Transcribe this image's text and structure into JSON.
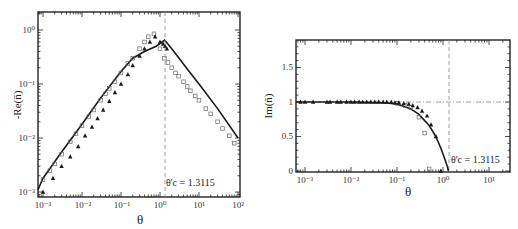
{
  "chart_data": [
    {
      "type": "scatter",
      "panel": "left",
      "title": "",
      "xlabel": "θ",
      "ylabel": "-Re(n̄)",
      "xscale": "log",
      "yscale": "log",
      "xlim": [
        0.0006,
        100
      ],
      "ylim": [
        0.0008,
        2
      ],
      "xticks": [
        "10^-3",
        "10^-2",
        "10^-1",
        "10^0",
        "10^1",
        "10^2"
      ],
      "yticks": [
        "10^-3",
        "10^-2",
        "10^-1",
        "10^0"
      ],
      "grid": false,
      "legend": null,
      "annotations": [
        {
          "text": "θ'c = 1.3115",
          "x": 1.3115,
          "type": "dashed-vertical-line"
        }
      ],
      "series": [
        {
          "name": "solid line",
          "style": "line",
          "x": [
            0.0006,
            0.001,
            0.003,
            0.01,
            0.03,
            0.1,
            0.2,
            0.4,
            0.8,
            1.3115,
            2,
            5,
            10,
            30,
            100
          ],
          "y": [
            0.0011,
            0.0018,
            0.0055,
            0.018,
            0.055,
            0.17,
            0.3,
            0.4,
            0.5,
            0.65,
            0.45,
            0.19,
            0.1,
            0.035,
            0.01
          ]
        },
        {
          "name": "open squares",
          "style": "square-open",
          "x": [
            0.0007,
            0.001,
            0.0015,
            0.002,
            0.003,
            0.005,
            0.007,
            0.01,
            0.015,
            0.02,
            0.03,
            0.04,
            0.05,
            0.07,
            0.1,
            0.15,
            0.2,
            0.3,
            0.4,
            0.5,
            0.7,
            1.0,
            1.3,
            1.6,
            2.0,
            2.5,
            3.0,
            4.0,
            5.0,
            6.0,
            8.0,
            10,
            15,
            20,
            30,
            40,
            60,
            80
          ],
          "y": [
            0.0012,
            0.0017,
            0.0025,
            0.0033,
            0.005,
            0.0085,
            0.012,
            0.017,
            0.025,
            0.033,
            0.05,
            0.066,
            0.083,
            0.11,
            0.16,
            0.24,
            0.3,
            0.45,
            0.6,
            0.75,
            0.85,
            0.45,
            0.3,
            0.25,
            0.2,
            0.16,
            0.14,
            0.11,
            0.09,
            0.075,
            0.06,
            0.05,
            0.035,
            0.028,
            0.02,
            0.015,
            0.011,
            0.008
          ]
        },
        {
          "name": "filled triangles",
          "style": "triangle-filled",
          "x": [
            0.001,
            0.0018,
            0.003,
            0.005,
            0.008,
            0.012,
            0.018,
            0.025,
            0.035,
            0.05,
            0.07,
            0.1,
            0.15,
            0.2,
            0.3,
            0.4,
            0.55,
            0.75,
            1.0,
            1.2,
            1.35,
            1.5
          ],
          "y": [
            0.001,
            0.0018,
            0.003,
            0.0045,
            0.007,
            0.011,
            0.016,
            0.023,
            0.033,
            0.048,
            0.07,
            0.1,
            0.15,
            0.22,
            0.33,
            0.45,
            0.6,
            0.75,
            0.6,
            0.55,
            0.5,
            0.45
          ]
        }
      ]
    },
    {
      "type": "scatter",
      "panel": "right",
      "title": "",
      "xlabel": "θ",
      "ylabel": "Im(n̄)",
      "xscale": "log",
      "yscale": "linear",
      "xlim": [
        0.0006,
        30
      ],
      "ylim": [
        0,
        1.9
      ],
      "xticks": [
        "10^-3",
        "10^-2",
        "10^-1",
        "10^0",
        "10^1"
      ],
      "yticks": [
        "0",
        "0.5",
        "1",
        "1.5"
      ],
      "grid": false,
      "legend": null,
      "annotations": [
        {
          "text": "θ'c = 1.3115",
          "x": 1.3115,
          "type": "dashed-vertical-line"
        },
        {
          "text": "",
          "y": 1,
          "type": "dash-dot-horizontal-line"
        }
      ],
      "series": [
        {
          "name": "solid line",
          "style": "line",
          "x": [
            0.0006,
            0.01,
            0.05,
            0.1,
            0.2,
            0.3,
            0.5,
            0.7,
            0.9,
            1.1,
            1.25,
            1.3115
          ],
          "y": [
            1.0,
            1.0,
            0.99,
            0.97,
            0.9,
            0.82,
            0.66,
            0.5,
            0.33,
            0.17,
            0.06,
            0.0
          ]
        },
        {
          "name": "open squares",
          "style": "square-open",
          "x": [
            0.1,
            0.15,
            0.2,
            0.3,
            0.4,
            0.5
          ],
          "y": [
            0.98,
            0.95,
            0.92,
            0.78,
            0.55,
            0.03
          ]
        },
        {
          "name": "filled triangles",
          "style": "triangle-filled",
          "x": [
            0.0008,
            0.001,
            0.0015,
            0.003,
            0.0035,
            0.005,
            0.006,
            0.008,
            0.01,
            0.012,
            0.015,
            0.018,
            0.022,
            0.027,
            0.033,
            0.04,
            0.05,
            0.06,
            0.075,
            0.09,
            0.11,
            0.14,
            0.18,
            0.22,
            0.28,
            0.35,
            0.45,
            0.55,
            0.7,
            0.9
          ],
          "y": [
            1.0,
            1.0,
            1.0,
            1.0,
            1.0,
            1.0,
            1.0,
            1.0,
            1.0,
            1.0,
            1.0,
            1.0,
            1.0,
            1.0,
            1.0,
            1.0,
            1.0,
            1.0,
            1.0,
            0.99,
            0.99,
            0.98,
            0.97,
            0.95,
            0.92,
            0.87,
            0.8,
            0.67,
            0.5,
            0.0
          ]
        }
      ]
    }
  ],
  "labels": {
    "left": {
      "ylabel": "-Re(n̄)",
      "xlabel": "θ",
      "annotation": "θ'c = 1.3115",
      "xticks": [
        "10⁻³",
        "10⁻²",
        "10⁻¹",
        "10⁰",
        "10¹",
        "10²"
      ],
      "yticks": [
        "10⁰",
        "10⁻¹",
        "10⁻²",
        "10⁻³"
      ]
    },
    "right": {
      "ylabel": "Im(n̄)",
      "xlabel": "θ",
      "annotation": "θ'c = 1.3115",
      "xticks": [
        "10⁻³",
        "10⁻²",
        "10⁻¹",
        "10⁰",
        "10¹"
      ],
      "yticks": [
        "1.5",
        "1",
        "0.5",
        "0"
      ]
    }
  }
}
